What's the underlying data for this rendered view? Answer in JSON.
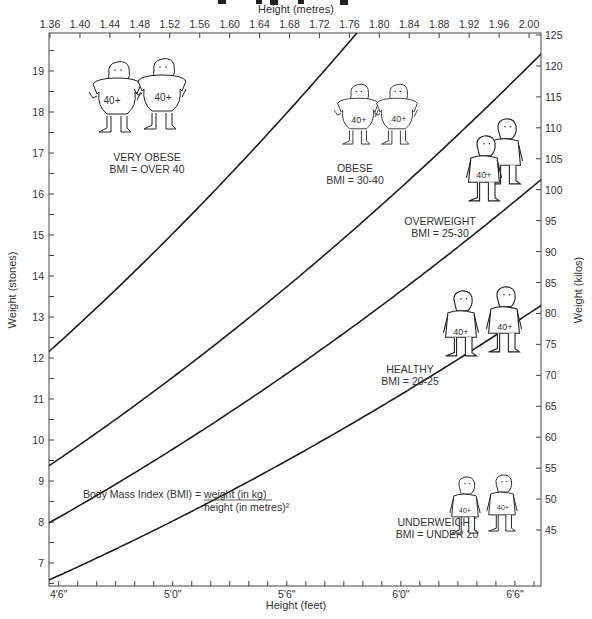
{
  "chart_data": {
    "type": "line",
    "title": "",
    "x_top": {
      "label": "Height (metres)",
      "ticks": [
        "1.36",
        "1.40",
        "1.44",
        "1.48",
        "1.52",
        "1.56",
        "1.60",
        "1.64",
        "1.68",
        "1.72",
        "1.76",
        "1.80",
        "1.84",
        "1.88",
        "1.92",
        "1.96",
        "2.00"
      ],
      "range": [
        1.36,
        2.03
      ]
    },
    "x_bottom": {
      "label": "Height (feet)",
      "ticks": [
        "4'6\"",
        "5'0\"",
        "5'6\"",
        "6'0\"",
        "6'6\""
      ]
    },
    "y_left": {
      "label": "Weight (stones)",
      "ticks": [
        "7",
        "8",
        "9",
        "10",
        "11",
        "12",
        "13",
        "14",
        "15",
        "16",
        "17",
        "18",
        "19"
      ],
      "range": [
        6.5,
        19.8
      ]
    },
    "y_right": {
      "label": "Weight (kilos)",
      "ticks": [
        "45",
        "50",
        "55",
        "60",
        "65",
        "70",
        "75",
        "80",
        "85",
        "90",
        "95",
        "100",
        "105",
        "110",
        "115",
        "120",
        "125"
      ],
      "range": [
        41,
        125
      ]
    },
    "series": [
      {
        "name": "BMI 40 boundary",
        "bmi": 40,
        "x_m": [
          1.36,
          1.44,
          1.52,
          1.6,
          1.68,
          1.755
        ],
        "y_kg": [
          74.0,
          82.9,
          92.4,
          102.4,
          112.9,
          123.2
        ]
      },
      {
        "name": "BMI 30 boundary",
        "bmi": 30,
        "x_m": [
          1.36,
          1.48,
          1.6,
          1.72,
          1.84,
          2.03
        ],
        "y_kg": [
          55.5,
          65.7,
          76.8,
          88.8,
          101.6,
          123.6
        ]
      },
      {
        "name": "BMI 25 boundary",
        "bmi": 25,
        "x_m": [
          1.36,
          1.48,
          1.6,
          1.72,
          1.84,
          2.03
        ],
        "y_kg": [
          46.2,
          54.8,
          64.0,
          74.0,
          84.6,
          103.0
        ]
      },
      {
        "name": "BMI 20 boundary",
        "bmi": 20,
        "x_m": [
          1.52,
          1.6,
          1.72,
          1.84,
          1.96,
          2.03
        ],
        "y_kg": [
          46.2,
          51.2,
          59.2,
          67.7,
          76.8,
          82.4
        ]
      }
    ],
    "zones": [
      {
        "name": "VERY OBESE",
        "range": "BMI = OVER 40"
      },
      {
        "name": "OBESE",
        "range": "BMI = 30-40"
      },
      {
        "name": "OVERWEIGHT",
        "range": "BMI = 25-30"
      },
      {
        "name": "HEALTHY",
        "range": "BMI = 20-25"
      },
      {
        "name": "UNDERWEIGHT",
        "range": "BMI = UNDER 20"
      }
    ],
    "annotation": {
      "formula_prefix": "Body Mass Index (BMI) =",
      "numerator": "weight (in kg)",
      "denominator": "height (in metres)²"
    },
    "figure_shirt_text": "40+",
    "grid": false,
    "legend": "none"
  },
  "labels": {
    "top_axis_title": "Height (metres)",
    "bottom_axis_title": "Height (feet)",
    "left_axis_title": "Weight (stones)",
    "right_axis_title": "Weight (kilos)",
    "zone_very_obese_name": "VERY OBESE",
    "zone_very_obese_range": "BMI = OVER 40",
    "zone_obese_name": "OBESE",
    "zone_obese_range": "BMI = 30-40",
    "zone_overweight_name": "OVERWEIGHT",
    "zone_overweight_range": "BMI = 25-30",
    "zone_healthy_name": "HEALTHY",
    "zone_healthy_range": "BMI = 20-25",
    "zone_underweight_name": "UNDERWEIGHT",
    "zone_underweight_range": "BMI = UNDER 20",
    "formula_prefix": "Body Mass Index (BMI) =",
    "formula_numerator": "weight (in kg)",
    "formula_denominator": "height (in metres)²",
    "shirt": "40+"
  },
  "colors": {
    "line": "#1e1e1e",
    "axis": "#444444",
    "text": "#333333",
    "background": "#ffffff"
  }
}
